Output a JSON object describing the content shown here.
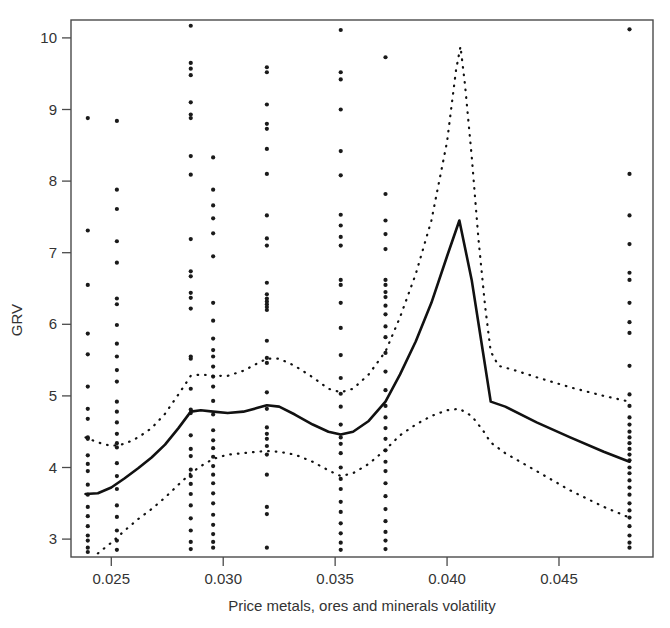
{
  "figure": {
    "background": "#ffffff",
    "ink_color": "#111111"
  },
  "axes": {
    "y_title": "GRV",
    "x_title": "Price metals, ores and minerals volatility",
    "y_ticks": [
      "3",
      "4",
      "5",
      "6",
      "7",
      "8",
      "9",
      "10"
    ],
    "x_ticks": [
      "0.025",
      "0.030",
      "0.035",
      "0.040",
      "0.045"
    ]
  },
  "chart_data": {
    "type": "scatter",
    "title": "",
    "xlabel": "Price metals, ores and minerals volatility",
    "ylabel": "GRV",
    "xlim": [
      0.0232,
      0.0492
    ],
    "ylim": [
      2.75,
      10.25
    ],
    "grid": false,
    "legend": "none",
    "x_ticks": [
      0.025,
      0.03,
      0.035,
      0.04,
      0.045
    ],
    "y_ticks": [
      3,
      4,
      5,
      6,
      7,
      8,
      9,
      10
    ],
    "note": "Partial-effect plot: solid line is the fitted smooth, dotted lines are pointwise confidence bounds; points are observations clustered at discrete volatility values.",
    "series": [
      {
        "name": "Observations",
        "style": "points",
        "x_columns": [
          0.02395,
          0.02525,
          0.02855,
          0.02955,
          0.03195,
          0.03525,
          0.03725,
          0.04815
        ],
        "points": [
          {
            "x": 0.02395,
            "y": [
              8.88,
              7.31,
              6.55,
              5.87,
              5.58,
              5.13,
              4.82,
              4.68,
              4.42,
              4.4,
              4.17,
              4.05,
              3.95,
              3.76,
              3.62,
              3.45,
              3.32,
              3.18,
              3.05,
              2.98,
              2.88,
              2.82
            ]
          },
          {
            "x": 0.02525,
            "y": [
              8.84,
              7.88,
              7.61,
              7.16,
              6.86,
              6.36,
              6.28,
              5.99,
              5.73,
              5.55,
              5.36,
              5.2,
              4.92,
              4.78,
              4.63,
              4.47,
              4.34,
              4.28,
              4.06,
              3.88,
              3.7,
              3.47,
              3.31,
              3.12,
              2.98,
              2.85
            ]
          },
          {
            "x": 0.02855,
            "y": [
              10.17,
              9.65,
              9.57,
              9.48,
              9.1,
              8.93,
              8.88,
              8.35,
              8.09,
              7.19,
              6.74,
              6.67,
              6.44,
              6.37,
              6.22,
              5.55,
              5.52,
              5.1,
              4.81,
              4.76,
              4.45,
              4.26,
              4.16,
              3.97,
              3.88,
              3.77,
              3.63,
              3.47,
              3.29,
              3.12,
              2.96,
              2.86
            ]
          },
          {
            "x": 0.02955,
            "y": [
              8.33,
              7.88,
              7.66,
              7.48,
              7.27,
              6.95,
              6.3,
              6.05,
              5.8,
              5.64,
              5.55,
              5.41,
              5.27,
              5.13,
              4.93,
              4.74,
              4.52,
              4.38,
              4.27,
              4.15,
              4.02,
              3.9,
              3.78,
              3.64,
              3.5,
              3.34,
              3.2,
              3.07,
              2.96,
              2.88
            ]
          },
          {
            "x": 0.03195,
            "y": [
              9.59,
              9.52,
              9.07,
              8.8,
              8.73,
              8.45,
              8.1,
              7.52,
              7.2,
              7.1,
              6.58,
              6.42,
              6.36,
              6.32,
              6.28,
              6.24,
              6.2,
              5.77,
              5.53,
              5.46,
              5.05,
              4.82,
              4.56,
              4.47,
              4.4,
              4.3,
              4.18,
              3.9,
              3.45,
              3.35,
              2.88
            ]
          },
          {
            "x": 0.03525,
            "y": [
              10.11,
              9.52,
              9.42,
              9.0,
              8.42,
              8.08,
              7.53,
              7.38,
              7.22,
              7.1,
              6.62,
              6.55,
              6.3,
              5.95,
              5.57,
              5.25,
              5.03,
              4.85,
              4.6,
              4.42,
              4.33,
              4.2,
              4.0,
              3.84,
              3.7,
              3.52,
              3.38,
              3.22,
              3.08,
              2.95,
              2.85
            ]
          },
          {
            "x": 0.03725,
            "y": [
              9.73,
              7.82,
              7.45,
              7.26,
              7.05,
              6.62,
              6.55,
              6.45,
              6.38,
              6.26,
              6.14,
              5.97,
              5.82,
              5.6,
              5.34,
              5.08,
              4.86,
              4.7,
              4.55,
              4.4,
              4.24,
              4.08,
              3.95,
              3.78,
              3.6,
              3.42,
              3.25,
              3.1,
              2.98,
              2.86
            ]
          },
          {
            "x": 0.04815,
            "y": [
              10.12,
              8.1,
              7.52,
              7.12,
              6.72,
              6.62,
              6.3,
              6.03,
              5.88,
              5.42,
              5.02,
              4.86,
              4.7,
              4.6,
              4.5,
              4.42,
              4.34,
              4.26,
              4.18,
              4.1,
              4.0,
              3.92,
              3.82,
              3.72,
              3.62,
              3.5,
              3.4,
              3.3,
              3.18,
              3.05,
              2.95,
              2.88
            ]
          }
        ]
      },
      {
        "name": "Fitted smooth",
        "style": "solid-line",
        "points": [
          [
            0.02385,
            3.63
          ],
          [
            0.0244,
            3.64
          ],
          [
            0.025,
            3.72
          ],
          [
            0.0256,
            3.85
          ],
          [
            0.0262,
            3.99
          ],
          [
            0.0268,
            4.14
          ],
          [
            0.0274,
            4.32
          ],
          [
            0.028,
            4.55
          ],
          [
            0.02855,
            4.78
          ],
          [
            0.029,
            4.8
          ],
          [
            0.02955,
            4.78
          ],
          [
            0.0302,
            4.76
          ],
          [
            0.0309,
            4.78
          ],
          [
            0.0315,
            4.83
          ],
          [
            0.03195,
            4.87
          ],
          [
            0.0325,
            4.85
          ],
          [
            0.0332,
            4.74
          ],
          [
            0.034,
            4.6
          ],
          [
            0.0347,
            4.5
          ],
          [
            0.03525,
            4.46
          ],
          [
            0.0358,
            4.5
          ],
          [
            0.0365,
            4.65
          ],
          [
            0.03725,
            4.92
          ],
          [
            0.0379,
            5.3
          ],
          [
            0.0386,
            5.76
          ],
          [
            0.0393,
            6.3
          ],
          [
            0.04,
            6.95
          ],
          [
            0.04055,
            7.45
          ],
          [
            0.0411,
            6.62
          ],
          [
            0.0416,
            5.62
          ],
          [
            0.04195,
            4.92
          ],
          [
            0.0426,
            4.85
          ],
          [
            0.044,
            4.63
          ],
          [
            0.0455,
            4.42
          ],
          [
            0.047,
            4.22
          ],
          [
            0.04815,
            4.08
          ]
        ]
      },
      {
        "name": "Upper confidence bound",
        "style": "dotted-line",
        "points": [
          [
            0.02385,
            4.42
          ],
          [
            0.0244,
            4.35
          ],
          [
            0.025,
            4.3
          ],
          [
            0.0256,
            4.33
          ],
          [
            0.0262,
            4.42
          ],
          [
            0.0268,
            4.55
          ],
          [
            0.0274,
            4.75
          ],
          [
            0.028,
            5.02
          ],
          [
            0.02855,
            5.28
          ],
          [
            0.029,
            5.3
          ],
          [
            0.02955,
            5.28
          ],
          [
            0.0302,
            5.28
          ],
          [
            0.0309,
            5.35
          ],
          [
            0.0315,
            5.45
          ],
          [
            0.03195,
            5.52
          ],
          [
            0.0325,
            5.52
          ],
          [
            0.0332,
            5.42
          ],
          [
            0.034,
            5.26
          ],
          [
            0.0347,
            5.1
          ],
          [
            0.03525,
            5.05
          ],
          [
            0.0358,
            5.1
          ],
          [
            0.0365,
            5.3
          ],
          [
            0.03725,
            5.62
          ],
          [
            0.0379,
            6.1
          ],
          [
            0.0386,
            6.7
          ],
          [
            0.0393,
            7.45
          ],
          [
            0.04,
            8.55
          ],
          [
            0.0404,
            9.55
          ],
          [
            0.0406,
            9.88
          ],
          [
            0.0408,
            9.35
          ],
          [
            0.0411,
            8.35
          ],
          [
            0.0414,
            7.2
          ],
          [
            0.0417,
            6.25
          ],
          [
            0.04195,
            5.62
          ],
          [
            0.0423,
            5.42
          ],
          [
            0.043,
            5.36
          ],
          [
            0.044,
            5.26
          ],
          [
            0.0455,
            5.12
          ],
          [
            0.047,
            5.0
          ],
          [
            0.04815,
            4.92
          ]
        ]
      },
      {
        "name": "Lower confidence bound",
        "style": "dotted-line",
        "points": [
          [
            0.0244,
            2.8
          ],
          [
            0.025,
            2.95
          ],
          [
            0.0256,
            3.12
          ],
          [
            0.0262,
            3.28
          ],
          [
            0.0268,
            3.42
          ],
          [
            0.0274,
            3.58
          ],
          [
            0.028,
            3.76
          ],
          [
            0.02855,
            3.92
          ],
          [
            0.029,
            4.02
          ],
          [
            0.02955,
            4.12
          ],
          [
            0.0302,
            4.18
          ],
          [
            0.0309,
            4.2
          ],
          [
            0.0315,
            4.22
          ],
          [
            0.03195,
            4.23
          ],
          [
            0.0325,
            4.22
          ],
          [
            0.0332,
            4.18
          ],
          [
            0.034,
            4.08
          ],
          [
            0.0347,
            3.96
          ],
          [
            0.03525,
            3.88
          ],
          [
            0.0358,
            3.92
          ],
          [
            0.0365,
            4.05
          ],
          [
            0.03725,
            4.25
          ],
          [
            0.0379,
            4.45
          ],
          [
            0.0386,
            4.6
          ],
          [
            0.0393,
            4.72
          ],
          [
            0.04,
            4.8
          ],
          [
            0.04055,
            4.82
          ],
          [
            0.0411,
            4.72
          ],
          [
            0.0416,
            4.52
          ],
          [
            0.04195,
            4.35
          ],
          [
            0.0426,
            4.2
          ],
          [
            0.044,
            3.95
          ],
          [
            0.0455,
            3.68
          ],
          [
            0.047,
            3.45
          ],
          [
            0.04815,
            3.3
          ]
        ]
      }
    ]
  }
}
